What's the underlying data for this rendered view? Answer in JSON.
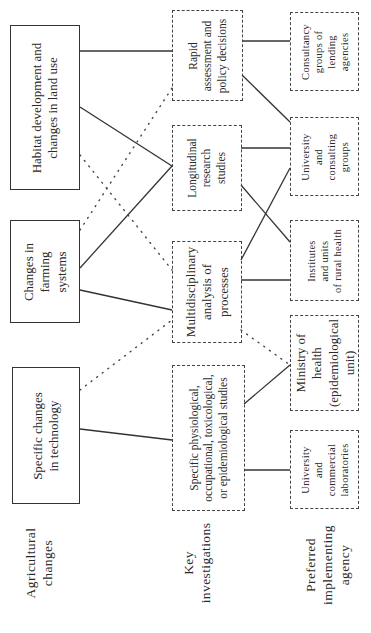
{
  "diagram": {
    "orientation": "rotated-90-ccw",
    "columns": [
      {
        "label": [
          "Agricultural",
          "changes"
        ],
        "nodes": [
          {
            "id": "habitat",
            "lines": [
              "Habitat development and",
              "changes in land use"
            ],
            "border": "solid"
          },
          {
            "id": "farming",
            "lines": [
              "Changes in",
              "farming",
              "systems"
            ],
            "border": "solid"
          },
          {
            "id": "technology",
            "lines": [
              "Specific changes",
              "in technology"
            ],
            "border": "solid"
          }
        ]
      },
      {
        "label": [
          "Key",
          "investigations"
        ],
        "nodes": [
          {
            "id": "rapid",
            "lines": [
              "Rapid",
              "assessment and",
              "policy decisions"
            ],
            "border": "dashed"
          },
          {
            "id": "longitudinal",
            "lines": [
              "Longitudinal",
              "research",
              "studies"
            ],
            "border": "dashed"
          },
          {
            "id": "multidisciplinary",
            "lines": [
              "Multidisciplinary",
              "analysis of",
              "processes"
            ],
            "border": "dashed"
          },
          {
            "id": "specific",
            "lines": [
              "Specific physiological,",
              "occupational, toxicological,",
              "or epidemiological studies"
            ],
            "border": "dashed"
          }
        ]
      },
      {
        "label": [
          "Preferred",
          "implementing",
          "agency"
        ],
        "nodes": [
          {
            "id": "consultancy",
            "lines": [
              "Consultancy",
              "groups of",
              "lending",
              "agencies"
            ],
            "border": "dashed"
          },
          {
            "id": "univ_consulting",
            "lines": [
              "University",
              "and",
              "consulting",
              "groups"
            ],
            "border": "dashed"
          },
          {
            "id": "institutes",
            "lines": [
              "Institutes",
              "and units",
              "of rural health"
            ],
            "border": "dashed"
          },
          {
            "id": "ministry",
            "lines": [
              "Ministry of",
              "health",
              "(epidemiological",
              "unit)"
            ],
            "border": "dashed"
          },
          {
            "id": "univ_commercial",
            "lines": [
              "University",
              "and",
              "commercial",
              "laboratories"
            ],
            "border": "dashed"
          }
        ]
      }
    ],
    "edges": [
      {
        "from": "habitat",
        "to": "rapid",
        "style": "solid"
      },
      {
        "from": "habitat",
        "to": "longitudinal",
        "style": "solid"
      },
      {
        "from": "habitat",
        "to": "multidisciplinary",
        "style": "dotted"
      },
      {
        "from": "farming",
        "to": "rapid",
        "style": "dotted"
      },
      {
        "from": "farming",
        "to": "longitudinal",
        "style": "solid"
      },
      {
        "from": "farming",
        "to": "multidisciplinary",
        "style": "solid"
      },
      {
        "from": "technology",
        "to": "multidisciplinary",
        "style": "dotted"
      },
      {
        "from": "technology",
        "to": "specific",
        "style": "solid"
      },
      {
        "from": "rapid",
        "to": "consultancy",
        "style": "solid"
      },
      {
        "from": "rapid",
        "to": "univ_consulting",
        "style": "solid"
      },
      {
        "from": "longitudinal",
        "to": "univ_consulting",
        "style": "solid"
      },
      {
        "from": "longitudinal",
        "to": "institutes",
        "style": "solid"
      },
      {
        "from": "multidisciplinary",
        "to": "univ_consulting",
        "style": "solid"
      },
      {
        "from": "multidisciplinary",
        "to": "institutes",
        "style": "solid"
      },
      {
        "from": "multidisciplinary",
        "to": "ministry",
        "style": "dotted"
      },
      {
        "from": "specific",
        "to": "ministry",
        "style": "solid"
      },
      {
        "from": "specific",
        "to": "univ_commercial",
        "style": "solid"
      }
    ]
  },
  "text": {
    "habitat": [
      "Habitat development and",
      "changes in land use"
    ],
    "farming": [
      "Changes in",
      "farming",
      "systems"
    ],
    "technology": [
      "Specific changes",
      "in technology"
    ],
    "rapid": [
      "Rapid",
      "assessment and",
      "policy decisions"
    ],
    "longitudinal": [
      "Longitudinal",
      "research",
      "studies"
    ],
    "multidisciplinary": [
      "Multidisciplinary",
      "analysis of",
      "processes"
    ],
    "specific": [
      "Specific physiological,",
      "occupational, toxicological,",
      "or epidemiological studies"
    ],
    "consultancy": [
      "Consultancy",
      "groups of",
      "lending",
      "agencies"
    ],
    "univ_consulting": [
      "University",
      "and",
      "consulting",
      "groups"
    ],
    "institutes": [
      "Institutes",
      "and units",
      "of rural health"
    ],
    "ministry": [
      "Ministry of",
      "health",
      "(epidemiological",
      "unit)"
    ],
    "univ_commercial": [
      "University",
      "and",
      "commercial",
      "laboratories"
    ],
    "label_agri": [
      "Agricultural",
      "changes"
    ],
    "label_key": [
      "Key",
      "investigations"
    ],
    "label_agency": [
      "Preferred",
      "implementing",
      "agency"
    ]
  }
}
